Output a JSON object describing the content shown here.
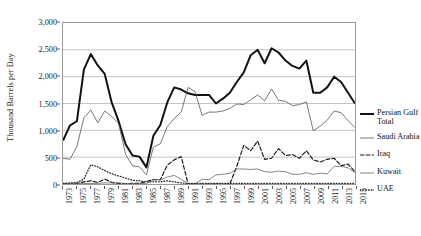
{
  "chart_data": {
    "type": "line",
    "title": "",
    "xlabel": "",
    "ylabel": "Thousand Barrels per Day",
    "ylim": [
      0,
      3000
    ],
    "yticks": [
      "0",
      "500",
      "1,000",
      "1,500",
      "2,000",
      "2,500",
      "3,000"
    ],
    "ytick_values": [
      0,
      500,
      1000,
      1500,
      2000,
      2500,
      3000
    ],
    "grid": true,
    "legend_position": "right",
    "x": [
      1973,
      1974,
      1975,
      1976,
      1977,
      1978,
      1979,
      1980,
      1981,
      1982,
      1983,
      1984,
      1985,
      1986,
      1987,
      1988,
      1989,
      1990,
      1991,
      1992,
      1993,
      1994,
      1995,
      1996,
      1997,
      1998,
      1999,
      2000,
      2001,
      2002,
      2003,
      2004,
      2005,
      2006,
      2007,
      2008,
      2009,
      2010,
      2011,
      2012,
      2013,
      2014,
      2015
    ],
    "xtick_labels": [
      "1973",
      "1975",
      "1977",
      "1979",
      "1981",
      "1983",
      "1985",
      "1987",
      "1989",
      "1991",
      "1993",
      "1995",
      "1997",
      "1999",
      "2001",
      "2003",
      "2005",
      "2007",
      "2009",
      "2011",
      "2013",
      "2015"
    ],
    "series": [
      {
        "name": "Persian Gulf Total",
        "style": "thick-solid",
        "color": "#111111",
        "values": [
          810,
          1090,
          1170,
          2130,
          2420,
          2210,
          2050,
          1520,
          1170,
          740,
          530,
          510,
          310,
          900,
          1100,
          1520,
          1800,
          1760,
          1690,
          1660,
          1660,
          1660,
          1500,
          1590,
          1700,
          1900,
          2080,
          2400,
          2500,
          2250,
          2530,
          2450,
          2300,
          2200,
          2150,
          2300,
          1700,
          1700,
          1800,
          2000,
          1900,
          1700,
          1500
        ],
        "peak_value": 2420,
        "peak_year": 1977,
        "trough_value": 310,
        "trough_year": 1985,
        "final_value": 1500
      },
      {
        "name": "Saudi Arabia",
        "style": "thin-solid",
        "color": "#555555",
        "values": [
          480,
          460,
          700,
          1230,
          1380,
          1140,
          1360,
          1260,
          1130,
          550,
          340,
          320,
          170,
          690,
          750,
          1070,
          1220,
          1340,
          1800,
          1720,
          1280,
          1340,
          1340,
          1360,
          1410,
          1490,
          1480,
          1570,
          1660,
          1550,
          1770,
          1560,
          1540,
          1460,
          1480,
          1530,
          990,
          1080,
          1190,
          1360,
          1330,
          1180,
          1050
        ],
        "peak_value": 1800,
        "peak_year": 1991
      },
      {
        "name": "Iraq",
        "style": "dashed",
        "color": "#1a1a1a",
        "values": [
          10,
          0,
          10,
          40,
          60,
          30,
          90,
          30,
          10,
          5,
          10,
          10,
          50,
          80,
          80,
          350,
          450,
          510,
          0,
          0,
          0,
          0,
          0,
          0,
          0,
          330,
          720,
          620,
          800,
          460,
          480,
          660,
          530,
          550,
          480,
          620,
          450,
          410,
          460,
          480,
          340,
          370,
          230
        ],
        "peak_value": 800,
        "peak_year": 2001
      },
      {
        "name": "Kuwait",
        "style": "thin-solid",
        "color": "#666666",
        "values": [
          10,
          5,
          5,
          10,
          10,
          10,
          20,
          20,
          20,
          10,
          10,
          10,
          5,
          80,
          80,
          130,
          160,
          90,
          0,
          0,
          90,
          80,
          170,
          180,
          200,
          280,
          280,
          270,
          280,
          230,
          220,
          240,
          230,
          180,
          180,
          210,
          180,
          200,
          190,
          330,
          330,
          300,
          210
        ],
        "peak_value": 330,
        "peak_year": 2012
      },
      {
        "name": "UAE",
        "style": "dotted",
        "color": "#333333",
        "values": [
          10,
          20,
          30,
          90,
          360,
          320,
          250,
          190,
          150,
          110,
          70,
          60,
          40,
          40,
          40,
          60,
          40,
          20,
          10,
          10,
          10,
          10,
          10,
          10,
          10,
          10,
          10,
          10,
          10,
          10,
          10,
          10,
          10,
          10,
          10,
          10,
          10,
          10,
          10,
          10,
          10,
          10,
          10
        ],
        "peak_value": 360,
        "peak_year": 1977
      }
    ]
  },
  "legend": {
    "items": [
      {
        "label": "Persian Gulf Total",
        "style": "thick-solid"
      },
      {
        "label": "Saudi Arabia",
        "style": "thin-solid"
      },
      {
        "label": "Iraq",
        "style": "dashed"
      },
      {
        "label": "Kuwait",
        "style": "thin-solid"
      },
      {
        "label": "UAE",
        "style": "dotted"
      }
    ]
  }
}
